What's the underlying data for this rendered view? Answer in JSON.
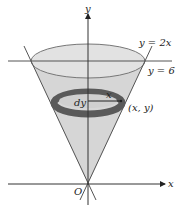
{
  "diagram": {
    "labels": {
      "y_axis": "y",
      "x_axis": "x",
      "origin": "O",
      "line_cone": "y = 2x",
      "line_top": "y = 6",
      "thickness": "dy",
      "radius": "x",
      "point": "(x, y)"
    },
    "colors": {
      "cone_fill": "#d4d4d4",
      "ring": "#5a5a5a",
      "axis": "#333333",
      "ellipse_stroke": "#6a6a6a"
    }
  }
}
